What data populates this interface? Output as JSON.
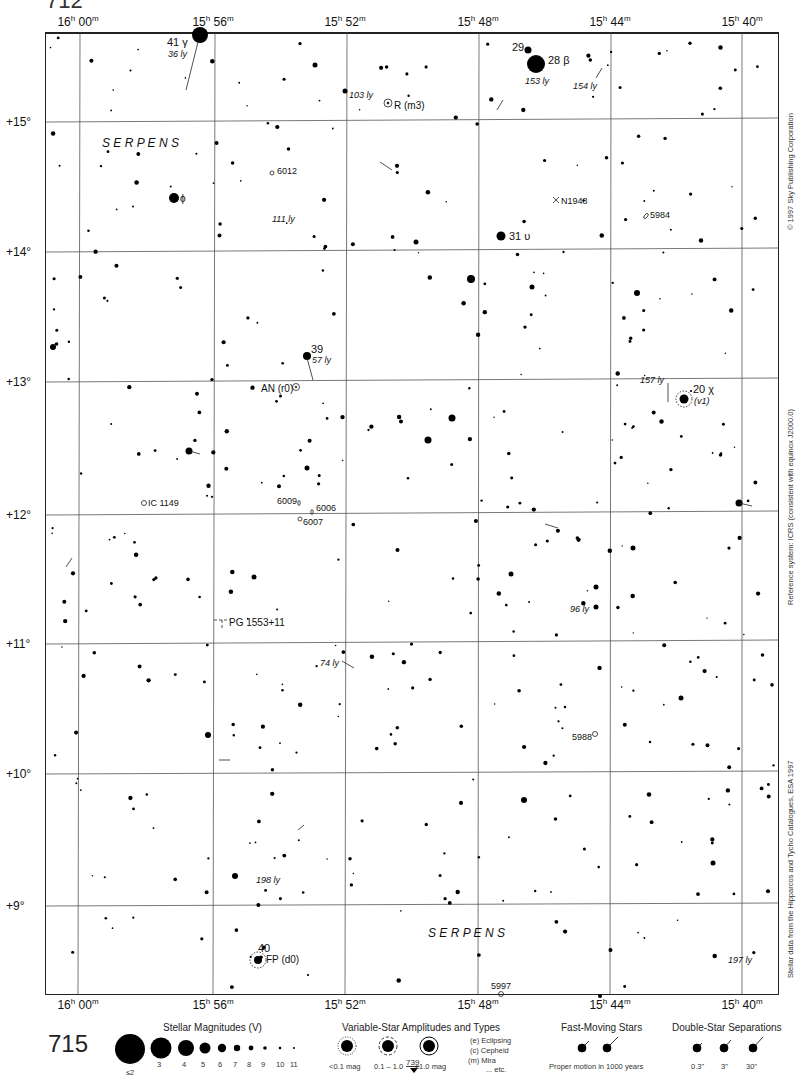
{
  "header": {
    "page_number_top": "712"
  },
  "map": {
    "ra_labels": [
      {
        "h": "16",
        "m": "00",
        "x": 78
      },
      {
        "h": "15",
        "m": "56",
        "x": 213
      },
      {
        "h": "15",
        "m": "52",
        "x": 345
      },
      {
        "h": "15",
        "m": "48",
        "x": 478
      },
      {
        "h": "15",
        "m": "44",
        "x": 610
      },
      {
        "h": "15",
        "m": "40",
        "x": 742
      }
    ],
    "dec_labels": [
      {
        "label": "+15°",
        "y": 122
      },
      {
        "label": "+14°",
        "y": 252
      },
      {
        "label": "+13°",
        "y": 382
      },
      {
        "label": "+12°",
        "y": 515
      },
      {
        "label": "+11°",
        "y": 644
      },
      {
        "label": "+10°",
        "y": 774
      },
      {
        "label": "+9°",
        "y": 906
      }
    ],
    "constellation_labels": [
      {
        "text": "S E R P E N S",
        "x": 102,
        "y": 147
      },
      {
        "text": "S E R P E N S",
        "x": 428,
        "y": 937
      }
    ],
    "objects": [
      {
        "name": "41 γ",
        "note": "36 ly"
      },
      {
        "name": "29"
      },
      {
        "name": "28 β",
        "note": "153 ly"
      },
      {
        "name": "154 ly"
      },
      {
        "name": "103 ly"
      },
      {
        "name": "R (m3)"
      },
      {
        "name": "6012"
      },
      {
        "name": "ϕ"
      },
      {
        "name": "111 ly"
      },
      {
        "name": "N1948"
      },
      {
        "name": "5984"
      },
      {
        "name": "31 υ"
      },
      {
        "name": "39",
        "note": "57 ly"
      },
      {
        "name": "AN (r0)"
      },
      {
        "name": "157 ly"
      },
      {
        "name": "20 χ",
        "note": "(v1)"
      },
      {
        "name": "IC 1149"
      },
      {
        "name": "6009"
      },
      {
        "name": "6006"
      },
      {
        "name": "6007"
      },
      {
        "name": "PG 1553+11"
      },
      {
        "name": "96 ly"
      },
      {
        "name": "74 ly"
      },
      {
        "name": "5988"
      },
      {
        "name": "198 ly"
      },
      {
        "name": "40",
        "note": "FP (d0)"
      },
      {
        "name": "5997"
      },
      {
        "name": "197 ly"
      }
    ]
  },
  "side_credits": {
    "copyright": "© 1997 Sky Publishing Corporation",
    "reference": "Reference system: ICRS (consistent with equinox J2000.0)",
    "data_source": "Stellar data from the Hipparcos and Tycho Catalogues, ESA 1997"
  },
  "legend": {
    "page_number": "715",
    "magnitudes": {
      "title": "Stellar Magnitudes (V)",
      "items": [
        "≤2",
        "3",
        "4",
        "5",
        "6",
        "7",
        "8",
        "9",
        "10",
        "11"
      ]
    },
    "variable": {
      "title": "Variable-Star Amplitudes and Types",
      "items": [
        "<0.1 mag",
        "0.1 – 1.0",
        "≥1.0 mag"
      ],
      "types": [
        "(e)  Eclipsing",
        "(c)  Cepheid",
        "(m)  Mira",
        "... etc."
      ],
      "next_page": "739"
    },
    "fast_moving": {
      "title": "Fast-Moving Stars",
      "caption": "Proper motion in 1000 years"
    },
    "double": {
      "title": "Double-Star Separations",
      "items": [
        "0.3\"",
        "3\"",
        "30\""
      ]
    }
  }
}
